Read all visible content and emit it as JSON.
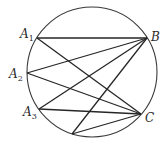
{
  "diagram": {
    "circle": {
      "cx": 92,
      "cy": 72,
      "r": 65,
      "stroke": "#3a3a3a"
    },
    "points": [
      {
        "id": "A1",
        "x": 37,
        "y": 38,
        "label": "A",
        "sub": "1",
        "lx": 20,
        "ly": 38
      },
      {
        "id": "A2",
        "x": 27,
        "y": 73,
        "label": "A",
        "sub": "2",
        "lx": 9,
        "ly": 78
      },
      {
        "id": "A3",
        "x": 39,
        "y": 109,
        "label": "A",
        "sub": "3",
        "lx": 23,
        "ly": 116
      },
      {
        "id": "B",
        "x": 147,
        "y": 38,
        "label": "B",
        "sub": "",
        "lx": 151,
        "ly": 41
      },
      {
        "id": "C",
        "x": 141,
        "y": 114,
        "label": "C",
        "sub": "",
        "lx": 145,
        "ly": 122
      },
      {
        "id": "D",
        "x": 72,
        "y": 134,
        "label": "",
        "sub": "",
        "lx": 0,
        "ly": 0
      }
    ],
    "segments": [
      [
        "A1",
        "B"
      ],
      [
        "A1",
        "C"
      ],
      [
        "A2",
        "B"
      ],
      [
        "A2",
        "C"
      ],
      [
        "A3",
        "B"
      ],
      [
        "A3",
        "C"
      ],
      [
        "D",
        "B"
      ],
      [
        "D",
        "C"
      ]
    ],
    "line_color": "#262626"
  }
}
